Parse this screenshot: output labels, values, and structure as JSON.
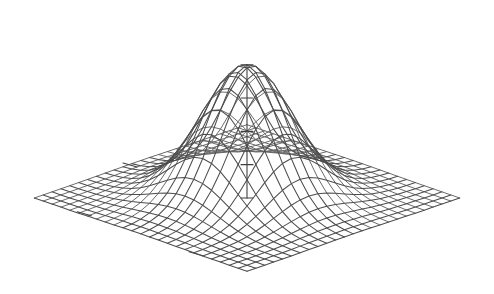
{
  "figure": {
    "background_color": "#ffffff",
    "line_color": "#4d4d4d",
    "axis_color": "#3f3f3f",
    "width": 494,
    "height": 294,
    "title": "",
    "subtitle": ""
  },
  "chart_data": {
    "type": "surface",
    "render": "wireframe-perspective",
    "title": "",
    "subtitle": "",
    "xlabel": "",
    "ylabel": "",
    "zlabel": "",
    "annotations": [],
    "legend": {
      "visible": false,
      "position": "none",
      "entries": []
    },
    "grid": {
      "visible": false
    },
    "axes": {
      "x": {
        "range": [
          -3,
          3
        ],
        "ticks": [
          -3,
          -1.5,
          0,
          1.5,
          3
        ],
        "tick_labels": []
      },
      "y": {
        "range": [
          -3,
          3
        ],
        "ticks": [
          -3,
          -1.5,
          0,
          1.5,
          3
        ],
        "tick_labels": []
      },
      "z": {
        "range": [
          0,
          1
        ],
        "ticks": [
          0,
          0.25,
          0.5,
          0.75,
          1.0
        ],
        "tick_labels": []
      }
    },
    "function": {
      "name": "bivariate-gaussian",
      "expression": "z = exp(-(x^2 + y^2) / 2)",
      "peak_value": 1.0,
      "peak_x": 0,
      "peak_y": 0,
      "sigma_x": 1.0,
      "sigma_y": 1.0
    },
    "mesh": {
      "nx": 25,
      "ny": 25,
      "x_min": -3.2,
      "x_max": 3.2,
      "y_min": -3.2,
      "y_max": 3.2
    },
    "view": {
      "theta_deg": 45,
      "phi_deg": 22,
      "z_scale": 0.93,
      "expand": 1.0,
      "center_x": 247,
      "center_y": 198,
      "scale": 47
    },
    "x": [
      -3.2,
      -2.933,
      -2.667,
      -2.4,
      -2.133,
      -1.867,
      -1.6,
      -1.333,
      -1.067,
      -0.8,
      -0.533,
      -0.267,
      0,
      0.267,
      0.533,
      0.8,
      1.067,
      1.333,
      1.6,
      1.867,
      2.133,
      2.4,
      2.667,
      2.933,
      3.2
    ],
    "y": [
      -3.2,
      -2.933,
      -2.667,
      -2.4,
      -2.133,
      -1.867,
      -1.6,
      -1.333,
      -1.067,
      -0.8,
      -0.533,
      -0.267,
      0,
      0.267,
      0.533,
      0.8,
      1.067,
      1.333,
      1.6,
      1.867,
      2.133,
      2.4,
      2.667,
      2.933,
      3.2
    ],
    "z_profile_center_row": [
      0.006,
      0.014,
      0.028,
      0.056,
      0.103,
      0.175,
      0.279,
      0.41,
      0.566,
      0.726,
      0.868,
      0.965,
      1.0,
      0.965,
      0.868,
      0.726,
      0.566,
      0.41,
      0.279,
      0.175,
      0.103,
      0.056,
      0.028,
      0.014,
      0.006
    ]
  }
}
